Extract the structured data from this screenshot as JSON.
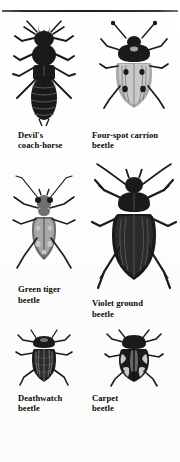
{
  "page": {
    "background_color": "#fdfdfc",
    "ink_color": "#1a1a1a",
    "rule_color": "#1d1d1d",
    "has_top_rule": true,
    "columns": 2,
    "rows": 3
  },
  "plate": {
    "specimens": [
      {
        "id": "devils-coach-horse",
        "caption_line1": "Devil's",
        "caption_line2": "coach-horse",
        "figure_name": "devils-coach-horse-illustration",
        "tone": "very-dark",
        "relative_size": "large",
        "body_style": "elongate-rove-beetle"
      },
      {
        "id": "four-spot-carrion-beetle",
        "caption_line1": "Four-spot carrion",
        "caption_line2": "beetle",
        "figure_name": "four-spot-carrion-beetle-illustration",
        "tone": "pale-with-dark-spots",
        "relative_size": "medium",
        "body_style": "oval-elytra",
        "spot_count": 4
      },
      {
        "id": "green-tiger-beetle",
        "caption_line1": "Green tiger",
        "caption_line2": "beetle",
        "figure_name": "green-tiger-beetle-illustration",
        "tone": "mid-grey-with-pale-spots",
        "relative_size": "medium",
        "body_style": "long-legged-tiger-beetle"
      },
      {
        "id": "violet-ground-beetle",
        "caption_line1": "Violet ground",
        "caption_line2": "beetle",
        "figure_name": "violet-ground-beetle-illustration",
        "tone": "very-dark",
        "relative_size": "largest",
        "body_style": "broad-oval-ground-beetle"
      },
      {
        "id": "deathwatch-beetle",
        "caption_line1": "Deathwatch",
        "caption_line2": "beetle",
        "figure_name": "deathwatch-beetle-illustration",
        "tone": "dark-mottled",
        "relative_size": "small",
        "body_style": "cylindrical-ribbed"
      },
      {
        "id": "carpet-beetle",
        "caption_line1": "Carpet",
        "caption_line2": "beetle",
        "figure_name": "carpet-beetle-illustration",
        "tone": "black-with-white-bands",
        "relative_size": "small",
        "body_style": "rounded-mottled"
      }
    ]
  }
}
